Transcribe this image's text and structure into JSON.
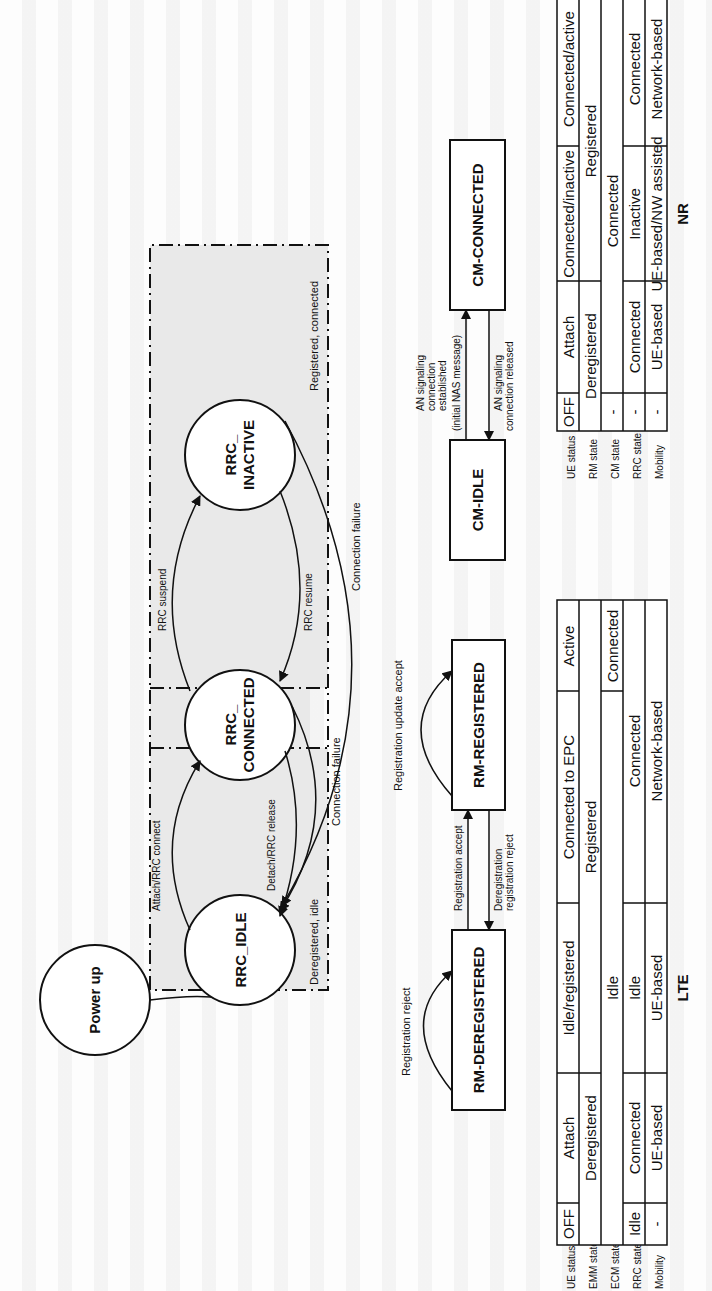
{
  "diagram": {
    "rrc_states": {
      "power_up": "Power up",
      "idle": "RRC_IDLE",
      "connected": [
        "RRC_",
        "CONNECTED"
      ],
      "inactive": [
        "RRC_",
        "INACTIVE"
      ]
    },
    "regions": {
      "deregistered_idle": "Deregistered, idle",
      "registered_connected": "Registered, connected"
    },
    "rrc_transitions": {
      "attach_connect": "Attach/RRC connect",
      "detach_release": "Detach/RRC release",
      "suspend": "RRC suspend",
      "resume": "RRC resume",
      "connection_failure_1": "Connection failure",
      "connection_failure_2": "Connection failure"
    },
    "rm_states": {
      "deregistered": "RM-DEREGISTERED",
      "registered": "RM-REGISTERED"
    },
    "rm_transitions": {
      "registration_reject": "Registration reject",
      "registration_accept": "Registration accept",
      "deregistration": [
        "Deregistration",
        "registration reject"
      ],
      "registration_update_accept": "Registration update accept"
    },
    "cm_states": {
      "idle": "CM-IDLE",
      "connected": "CM-CONNECTED"
    },
    "cm_transitions": {
      "established": [
        "AN signaling",
        "connection",
        "established",
        "(initial NAS message)"
      ],
      "released": [
        "AN signaling",
        "connection released"
      ]
    }
  },
  "tables": {
    "lte": {
      "title": "LTE",
      "row_labels": [
        "UE status",
        "EMM state",
        "ECM state",
        "RRC state",
        "Mobility"
      ],
      "ue_status": [
        "OFF",
        "Attach",
        "Idle/registered",
        "Connected to EPC",
        "Active"
      ],
      "emm_state": [
        "Deregistered",
        "Registered"
      ],
      "ecm_state": [
        "Idle",
        "Connected"
      ],
      "rrc_state": [
        "Idle",
        "Connected",
        "Idle",
        "Connected"
      ],
      "mobility": [
        "-",
        "UE-based",
        "UE-based",
        "Network-based"
      ]
    },
    "nr": {
      "title": "NR",
      "row_labels": [
        "UE status",
        "RM state",
        "CM state",
        "RRC state",
        "Mobility"
      ],
      "ue_status": [
        "OFF",
        "Attach",
        "Connected/inactive",
        "Connected/active"
      ],
      "rm_state": [
        "Deregistered",
        "Registered"
      ],
      "cm_state": [
        "-",
        "Connected"
      ],
      "rrc_state": [
        "-",
        "Connected",
        "Inactive",
        "Connected"
      ],
      "mobility": [
        "-",
        "UE-based",
        "UE-based/NW assisted",
        "Network-based"
      ]
    }
  }
}
